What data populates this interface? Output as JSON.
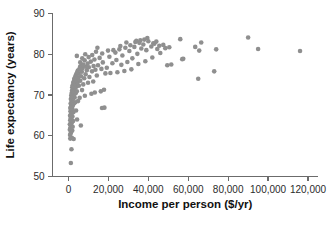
{
  "chart_data": {
    "type": "scatter",
    "title": "",
    "xlabel": "Income per person ($/yr)",
    "ylabel": "Life expectancy (years)",
    "xlim": [
      -8000,
      125000
    ],
    "ylim": [
      50,
      90
    ],
    "xticks": [
      0,
      20000,
      40000,
      60000,
      80000,
      100000,
      120000
    ],
    "xticklabels": [
      "0",
      "20,000",
      "40,000",
      "60,000",
      "80,000",
      "100,000",
      "120,000"
    ],
    "yticks": [
      50,
      60,
      70,
      80,
      90
    ],
    "yticklabels": [
      "50",
      "60",
      "70",
      "80",
      "90"
    ],
    "grid": false,
    "legend": false,
    "marker_color": "#8f8f8f",
    "marker_size": 2.3,
    "axis_color": "#6b6b6b",
    "points": [
      [
        1200,
        53.3
      ],
      [
        1500,
        56.7
      ],
      [
        900,
        59.3
      ],
      [
        1700,
        59.5
      ],
      [
        2600,
        59.2
      ],
      [
        800,
        60.2
      ],
      [
        1100,
        60.6
      ],
      [
        1400,
        61.0
      ],
      [
        700,
        61.5
      ],
      [
        1900,
        61.3
      ],
      [
        1000,
        62.0
      ],
      [
        1600,
        62.4
      ],
      [
        2100,
        62.2
      ],
      [
        700,
        62.8
      ],
      [
        1300,
        63.1
      ],
      [
        1800,
        63.4
      ],
      [
        900,
        63.8
      ],
      [
        2300,
        63.6
      ],
      [
        1100,
        64.2
      ],
      [
        1500,
        64.5
      ],
      [
        800,
        64.9
      ],
      [
        2000,
        64.7
      ],
      [
        1200,
        65.3
      ],
      [
        1700,
        65.6
      ],
      [
        1000,
        66.0
      ],
      [
        2500,
        65.8
      ],
      [
        1400,
        66.4
      ],
      [
        900,
        66.8
      ],
      [
        1900,
        66.6
      ],
      [
        6200,
        62.5
      ],
      [
        4300,
        64.0
      ],
      [
        3800,
        66.2
      ],
      [
        1300,
        67.2
      ],
      [
        1600,
        67.5
      ],
      [
        2200,
        67.4
      ],
      [
        1100,
        67.9
      ],
      [
        2800,
        68.0
      ],
      [
        1500,
        68.3
      ],
      [
        3400,
        68.2
      ],
      [
        1900,
        68.7
      ],
      [
        1200,
        69.0
      ],
      [
        4800,
        68.5
      ],
      [
        2400,
        69.2
      ],
      [
        1700,
        69.5
      ],
      [
        3100,
        69.4
      ],
      [
        1400,
        69.9
      ],
      [
        5600,
        69.3
      ],
      [
        2000,
        70.2
      ],
      [
        2700,
        70.1
      ],
      [
        1600,
        70.5
      ],
      [
        8200,
        69.8
      ],
      [
        3600,
        70.4
      ],
      [
        2200,
        70.8
      ],
      [
        1800,
        71.1
      ],
      [
        4200,
        70.9
      ],
      [
        11500,
        70.3
      ],
      [
        2500,
        71.4
      ],
      [
        3000,
        71.6
      ],
      [
        1900,
        71.9
      ],
      [
        6800,
        71.2
      ],
      [
        13200,
        70.6
      ],
      [
        2800,
        72.1
      ],
      [
        3900,
        72.0
      ],
      [
        2100,
        72.4
      ],
      [
        5200,
        72.3
      ],
      [
        16200,
        70.9
      ],
      [
        3300,
        72.7
      ],
      [
        2400,
        73.0
      ],
      [
        7400,
        72.6
      ],
      [
        4500,
        73.1
      ],
      [
        17800,
        71.3
      ],
      [
        2700,
        73.4
      ],
      [
        9800,
        73.0
      ],
      [
        3700,
        73.6
      ],
      [
        5900,
        73.5
      ],
      [
        2900,
        74.0
      ],
      [
        12400,
        73.3
      ],
      [
        4800,
        74.2
      ],
      [
        3400,
        74.5
      ],
      [
        7900,
        74.1
      ],
      [
        16800,
        66.8
      ],
      [
        6300,
        74.6
      ],
      [
        3800,
        75.0
      ],
      [
        10500,
        74.4
      ],
      [
        5100,
        75.2
      ],
      [
        14200,
        74.8
      ],
      [
        4300,
        75.5
      ],
      [
        8600,
        75.1
      ],
      [
        18500,
        75.3
      ],
      [
        6700,
        75.7
      ],
      [
        4700,
        76.0
      ],
      [
        21000,
        75.4
      ],
      [
        11800,
        75.8
      ],
      [
        5400,
        76.3
      ],
      [
        9200,
        76.1
      ],
      [
        24500,
        75.6
      ],
      [
        7100,
        76.6
      ],
      [
        13500,
        76.2
      ],
      [
        5800,
        76.9
      ],
      [
        28000,
        75.9
      ],
      [
        10200,
        76.8
      ],
      [
        16500,
        76.4
      ],
      [
        6400,
        77.2
      ],
      [
        8800,
        77.0
      ],
      [
        31500,
        76.3
      ],
      [
        12600,
        77.1
      ],
      [
        7300,
        77.5
      ],
      [
        19200,
        76.7
      ],
      [
        26500,
        77.4
      ],
      [
        9600,
        77.7
      ],
      [
        14800,
        77.3
      ],
      [
        5900,
        78.0
      ],
      [
        35000,
        77.6
      ],
      [
        11200,
        78.2
      ],
      [
        22000,
        77.8
      ],
      [
        8100,
        78.5
      ],
      [
        29500,
        78.1
      ],
      [
        17200,
        78.0
      ],
      [
        13000,
        78.7
      ],
      [
        6900,
        79.0
      ],
      [
        51500,
        77.5
      ],
      [
        24000,
        78.6
      ],
      [
        10100,
        79.3
      ],
      [
        38500,
        78.3
      ],
      [
        15600,
        79.1
      ],
      [
        4200,
        79.6
      ],
      [
        32000,
        79.0
      ],
      [
        20500,
        79.4
      ],
      [
        11900,
        79.8
      ],
      [
        57500,
        78.9
      ],
      [
        42000,
        79.2
      ],
      [
        27000,
        79.7
      ],
      [
        8400,
        80.0
      ],
      [
        16900,
        80.2
      ],
      [
        34500,
        80.1
      ],
      [
        23500,
        80.4
      ],
      [
        13800,
        80.6
      ],
      [
        46000,
        80.3
      ],
      [
        30500,
        80.8
      ],
      [
        19800,
        80.9
      ],
      [
        116000,
        80.8
      ],
      [
        39000,
        81.0
      ],
      [
        25500,
        81.2
      ],
      [
        65500,
        80.9
      ],
      [
        36500,
        81.4
      ],
      [
        44500,
        81.3
      ],
      [
        28500,
        81.6
      ],
      [
        74000,
        81.2
      ],
      [
        48500,
        81.5
      ],
      [
        33000,
        81.8
      ],
      [
        95000,
        81.3
      ],
      [
        41500,
        81.9
      ],
      [
        22500,
        81.0
      ],
      [
        50500,
        81.7
      ],
      [
        31000,
        82.2
      ],
      [
        45500,
        82.1
      ],
      [
        37500,
        82.4
      ],
      [
        26000,
        82.0
      ],
      [
        63500,
        81.8
      ],
      [
        43000,
        82.6
      ],
      [
        35500,
        82.8
      ],
      [
        14500,
        81.6
      ],
      [
        47500,
        82.3
      ],
      [
        40000,
        83.2
      ],
      [
        33500,
        83.0
      ],
      [
        29000,
        82.9
      ],
      [
        38000,
        83.6
      ],
      [
        44000,
        83.1
      ],
      [
        36000,
        83.4
      ],
      [
        42500,
        82.7
      ],
      [
        39500,
        84.0
      ],
      [
        34000,
        83.3
      ],
      [
        56000,
        83.7
      ],
      [
        90000,
        84.1
      ],
      [
        66500,
        82.9
      ],
      [
        73000,
        75.8
      ],
      [
        65000,
        74.0
      ],
      [
        57000,
        78.8
      ],
      [
        49500,
        77.3
      ],
      [
        18000,
        66.9
      ]
    ]
  }
}
